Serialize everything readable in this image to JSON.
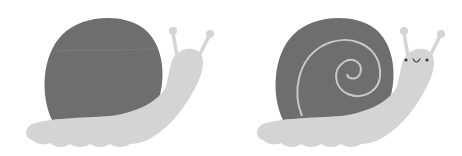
{
  "scene": {
    "description": "Two cartoon snails side by side",
    "background": "#ffffff",
    "colors": {
      "shell": "#6e6e6e",
      "body": "#d4d4d4",
      "spiral": "#c8c8c8",
      "face": "#3a3a3a"
    },
    "snails": [
      {
        "id": "plain-snail",
        "has_spiral": false,
        "has_face": false
      },
      {
        "id": "face-snail",
        "has_spiral": true,
        "has_face": true
      }
    ]
  }
}
